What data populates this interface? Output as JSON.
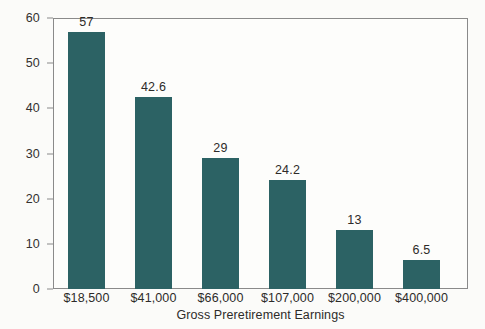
{
  "chart_data": {
    "type": "bar",
    "title": "",
    "subtitle": "",
    "xlabel": "Gross Preretirement Earnings",
    "ylabel": "",
    "categories": [
      "$18,500",
      "$41,000",
      "$66,000",
      "$107,000",
      "$200,000",
      "$400,000"
    ],
    "values": [
      57,
      42.6,
      29,
      24.2,
      13,
      6.5
    ],
    "value_labels": [
      "57",
      "42.6",
      "29",
      "24.2",
      "13",
      "6.5"
    ],
    "ylim": [
      0,
      60
    ],
    "yticks": [
      0,
      10,
      20,
      30,
      40,
      50,
      60
    ],
    "ytick_labels": [
      "0",
      "10",
      "20",
      "30",
      "40",
      "50",
      "60"
    ],
    "grid": false,
    "legend": null,
    "bar_color": "#2c6264",
    "axis_color": "#8a8a8a",
    "text_color": "#2d2b29",
    "background": "#fbfbf9"
  }
}
